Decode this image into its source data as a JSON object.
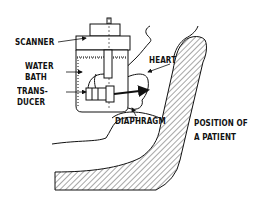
{
  "figure": {
    "type": "schematic",
    "colors": {
      "ink": "#111111",
      "background": "#ffffff"
    }
  },
  "labels": {
    "scanner": "SCANNER",
    "water_bath_1": "WATER",
    "water_bath_2": "BATH",
    "transducer_1": "TRANS-",
    "transducer_2": "DUCER",
    "heart": "HEART",
    "diaphragm": "DIAPHRAGM",
    "position_1": "POSITION OF",
    "position_2": "A PATIENT"
  }
}
